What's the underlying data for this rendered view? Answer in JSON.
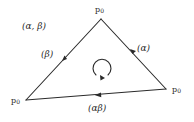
{
  "diagram": {
    "type": "triangle-loop",
    "vertices": [
      {
        "id": "top",
        "label": "p",
        "subscript": "0",
        "x": 101,
        "y": 19
      },
      {
        "id": "bottom-left",
        "label": "p",
        "subscript": "0",
        "x": 26,
        "y": 100
      },
      {
        "id": "bottom-right",
        "label": "p",
        "subscript": "0",
        "x": 166,
        "y": 89
      }
    ],
    "edges": [
      {
        "id": "right-edge",
        "from": "bottom-right",
        "to": "top",
        "label": "(α)"
      },
      {
        "id": "left-edge",
        "from": "top",
        "to": "bottom-left",
        "label": "(β)"
      },
      {
        "id": "bottom-edge",
        "from": "bottom-right",
        "to": "bottom-left",
        "label": "(αβ)"
      }
    ],
    "region_label": "(α, β)",
    "rotation": "clockwise",
    "colors": {
      "line": "#2a2a2a",
      "background": "#ffffff"
    }
  }
}
